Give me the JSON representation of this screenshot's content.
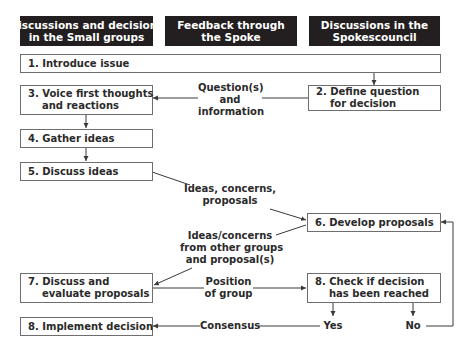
{
  "headers": [
    {
      "label": "Discussions and decisions\nin the Small groups"
    },
    {
      "label": "Feedback through\nthe Spoke"
    },
    {
      "label": "Discussions in the\nSpokescouncil"
    }
  ],
  "steps": {
    "s1": "1. Introduce issue",
    "s2": "2. Define question\n    for decision",
    "s3": "3. Voice first thoughts\n    and reactions",
    "s4": "4. Gather ideas",
    "s5": "5. Discuss ideas",
    "s6": "6. Develop proposals",
    "s7": "7. Discuss and\n    evaluate proposals",
    "s8check": "8. Check if decision\n    has been reached",
    "s8impl": "8. Implement decision"
  },
  "edge_labels": {
    "questions": "Question(s)\nand\ninformation",
    "ideas": "Ideas, concerns,\nproposals",
    "other_groups": "Ideas/concerns\nfrom other groups\nand proposal(s)",
    "position": "Position\nof group",
    "consensus": "Consensus",
    "yes": "Yes",
    "no": "No"
  },
  "colors": {
    "header_bg": "#231f20",
    "line": "#3a3a3a",
    "box_border": "#6e6e6e"
  }
}
